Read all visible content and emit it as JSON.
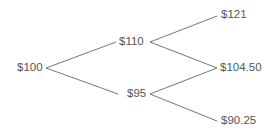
{
  "diagram": {
    "type": "binomial-tree",
    "line_color": "#666666",
    "text_color": "#555555",
    "nodes": [
      {
        "id": "root",
        "label": "$100"
      },
      {
        "id": "up",
        "label": "$110"
      },
      {
        "id": "down",
        "label": "$95"
      },
      {
        "id": "up-up",
        "label": "$121"
      },
      {
        "id": "up-down",
        "label": "$104.50"
      },
      {
        "id": "down-down",
        "label": "$90.25"
      }
    ],
    "edges": [
      {
        "from": "root",
        "to": "up"
      },
      {
        "from": "root",
        "to": "down"
      },
      {
        "from": "up",
        "to": "up-up"
      },
      {
        "from": "up",
        "to": "up-down"
      },
      {
        "from": "down",
        "to": "up-down"
      },
      {
        "from": "down",
        "to": "down-down"
      }
    ]
  }
}
